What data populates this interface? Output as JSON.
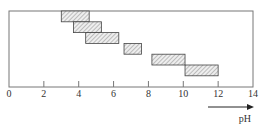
{
  "chart_data": {
    "type": "bar",
    "subtype": "floating-horizontal-range",
    "title": "",
    "xlabel": "pH",
    "ylabel": "",
    "xlim": [
      0,
      14
    ],
    "xticks": [
      0,
      2,
      4,
      6,
      8,
      10,
      12,
      14
    ],
    "xtick_labels": [
      "0",
      "2",
      "4",
      "6",
      "8",
      "10",
      "12",
      "14"
    ],
    "grid": false,
    "legend": null,
    "ranges": [
      {
        "start": 3.0,
        "end": 4.6
      },
      {
        "start": 3.7,
        "end": 5.3
      },
      {
        "start": 4.4,
        "end": 6.3
      },
      {
        "start": 6.6,
        "end": 7.6
      },
      {
        "start": 8.2,
        "end": 10.1
      },
      {
        "start": 10.1,
        "end": 12.0
      }
    ],
    "annotation": "arrow pointing right indicating increasing pH"
  },
  "colors": {
    "frame": "#777777",
    "bar_fill": "#e8e8e8",
    "hatch": "#888888",
    "bar_edge": "#444444",
    "text": "#333333"
  }
}
